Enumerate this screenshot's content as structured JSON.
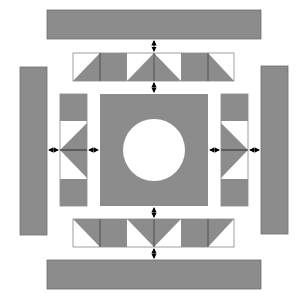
{
  "diagram": {
    "type": "quilt-layout",
    "colors": {
      "fill": "#8c8c8c",
      "background": "#ffffff",
      "stroke": "#555555",
      "arrow": "#000000"
    },
    "outer_bars": {
      "top": {
        "x": 47,
        "y": 10,
        "w": 214,
        "h": 29
      },
      "bottom": {
        "x": 47,
        "y": 260,
        "w": 214,
        "h": 29
      },
      "left": {
        "x": 20,
        "y": 67,
        "w": 27,
        "h": 168
      },
      "right": {
        "x": 261,
        "y": 66,
        "w": 27,
        "h": 168
      }
    },
    "center_block": {
      "x": 100,
      "y": 94,
      "w": 108,
      "h": 112,
      "circle_cx": 154,
      "circle_cy": 150,
      "circle_r": 31
    },
    "strips": {
      "top": {
        "x": 73,
        "y": 53,
        "cell": 27,
        "count": 6,
        "pattern": [
          "tri-lr",
          "full",
          "tri-lr",
          "tri-ll",
          "full",
          "tri-ll"
        ]
      },
      "bottom": {
        "x": 73,
        "y": 219,
        "cell": 27,
        "count": 6,
        "pattern": [
          "tri-ur",
          "full",
          "tri-ur",
          "tri-ul",
          "full",
          "tri-ul"
        ]
      },
      "left": {
        "x": 60,
        "y": 94,
        "w": 27,
        "h": 112,
        "pattern": [
          "full",
          "tri-top-right",
          "tri-bottom-right",
          "full"
        ]
      },
      "right": {
        "x": 221,
        "y": 94,
        "w": 27,
        "h": 112,
        "pattern": [
          "full",
          "tri-top-left",
          "tri-bottom-left",
          "full"
        ]
      }
    },
    "connectors": [
      {
        "orientation": "vertical",
        "from": "top-bar",
        "to": "top-strip"
      },
      {
        "orientation": "vertical",
        "from": "top-strip",
        "to": "center-block"
      },
      {
        "orientation": "vertical",
        "from": "center-block",
        "to": "bottom-strip"
      },
      {
        "orientation": "vertical",
        "from": "bottom-strip",
        "to": "bottom-bar"
      },
      {
        "orientation": "horizontal",
        "from": "left-bar",
        "to": "left-strip"
      },
      {
        "orientation": "horizontal",
        "from": "left-strip",
        "to": "center-block"
      },
      {
        "orientation": "horizontal",
        "from": "center-block",
        "to": "right-strip"
      },
      {
        "orientation": "horizontal",
        "from": "right-strip",
        "to": "right-bar"
      }
    ]
  }
}
